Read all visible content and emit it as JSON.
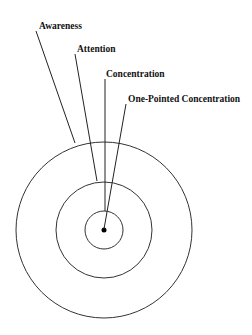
{
  "diagram": {
    "title": "",
    "labels": [
      {
        "id": "awareness",
        "text": "Awareness",
        "x": 39,
        "y": 29,
        "line": [
          36,
          31,
          75,
          143
        ]
      },
      {
        "id": "attention",
        "text": "Attention",
        "x": 77,
        "y": 52,
        "line": [
          75,
          54,
          97,
          181
        ]
      },
      {
        "id": "concentration",
        "text": "Concentration",
        "x": 106,
        "y": 77,
        "line": [
          105,
          79,
          105,
          211
        ]
      },
      {
        "id": "one-pointed-concentration",
        "text": "One-Pointed Concentration",
        "x": 128,
        "y": 102,
        "line": [
          126,
          104,
          104,
          229
        ]
      }
    ],
    "circles": [
      {
        "id": "outer-awareness-circle",
        "cx": 104,
        "cy": 230,
        "r": 88
      },
      {
        "id": "middle-attention-circle",
        "cx": 104,
        "cy": 230,
        "r": 48
      },
      {
        "id": "inner-concentration-circle",
        "cx": 104,
        "cy": 230,
        "r": 19
      }
    ],
    "center_point": {
      "cx": 104,
      "cy": 230,
      "r": 2.5
    },
    "colors": {
      "stroke": "#333333",
      "text": "#111111",
      "background": "#ffffff"
    }
  }
}
